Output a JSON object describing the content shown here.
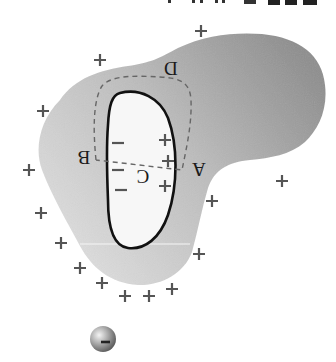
{
  "figure": {
    "orientation_degrees": 180,
    "colors": {
      "conductor_dark": "#8e8e8e",
      "conductor_light": "#e2e2e2",
      "cavity": "#f7f7f7",
      "cavity_outline": "#111111",
      "dashed_path": "#666666",
      "sign_color": "#555555"
    },
    "top_fragment_text": "… :/ /\\ … ɐ …",
    "labels": {
      "A": "A",
      "B": "B",
      "C": "C",
      "D": "D"
    },
    "cavity_inner_charges": {
      "minus": [
        "−",
        "−",
        "−"
      ],
      "plus": [
        "+",
        "+",
        "+"
      ]
    },
    "outer_surface_charges": {
      "plus_count": 14,
      "symbol": "+"
    },
    "electron": {
      "symbol": "−",
      "label": "electron"
    }
  }
}
